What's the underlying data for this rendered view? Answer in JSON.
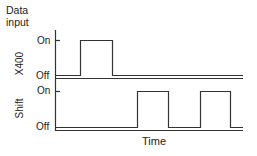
{
  "diagram": {
    "title_line1": "Data",
    "title_line2": "input",
    "x_axis_label": "Time",
    "panels": [
      {
        "name": "X400",
        "on_label": "On",
        "off_label": "Off",
        "pulses": [
          [
            80,
            112
          ]
        ]
      },
      {
        "name": "Shift",
        "on_label": "On",
        "off_label": "Off",
        "pulses": [
          [
            137,
            168
          ],
          [
            200,
            230
          ]
        ]
      }
    ],
    "colors": {
      "line": "#333333",
      "text": "#222222",
      "background": "#ffffff"
    }
  }
}
